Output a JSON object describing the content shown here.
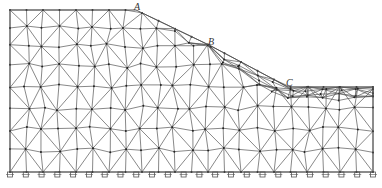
{
  "diagram": {
    "title": "",
    "labels": [
      {
        "id": "A",
        "text": "A",
        "x": 134,
        "y": 1
      },
      {
        "id": "B",
        "text": "B",
        "x": 208,
        "y": 36
      },
      {
        "id": "C",
        "text": "C",
        "x": 286,
        "y": 77
      }
    ],
    "colors": {
      "line": "#555555",
      "node": "#222222"
    },
    "boundary": [
      [
        10,
        10
      ],
      [
        136,
        10
      ],
      [
        211,
        46
      ],
      [
        288,
        87
      ],
      [
        373,
        87
      ],
      [
        373,
        172
      ],
      [
        10,
        172
      ]
    ],
    "support_count": 24
  }
}
